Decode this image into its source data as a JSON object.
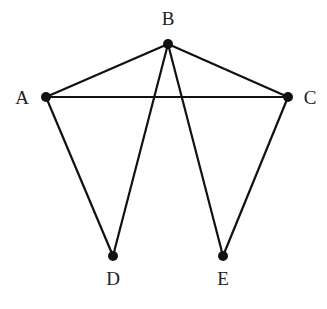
{
  "graph": {
    "nodes": [
      {
        "id": "A",
        "label": "A",
        "x": 46,
        "y": 97,
        "lx": 22,
        "ly": 104
      },
      {
        "id": "B",
        "label": "B",
        "x": 168,
        "y": 44,
        "lx": 168,
        "ly": 25
      },
      {
        "id": "C",
        "label": "C",
        "x": 288,
        "y": 97,
        "lx": 310,
        "ly": 104
      },
      {
        "id": "D",
        "label": "D",
        "x": 113,
        "y": 256,
        "lx": 113,
        "ly": 285
      },
      {
        "id": "E",
        "label": "E",
        "x": 223,
        "y": 256,
        "lx": 223,
        "ly": 285
      }
    ],
    "edges": [
      [
        "A",
        "B"
      ],
      [
        "B",
        "C"
      ],
      [
        "A",
        "C"
      ],
      [
        "A",
        "D"
      ],
      [
        "B",
        "D"
      ],
      [
        "B",
        "E"
      ],
      [
        "C",
        "E"
      ]
    ],
    "colors": {
      "edge": "#111111",
      "node": "#111111",
      "label": "#222222"
    }
  }
}
